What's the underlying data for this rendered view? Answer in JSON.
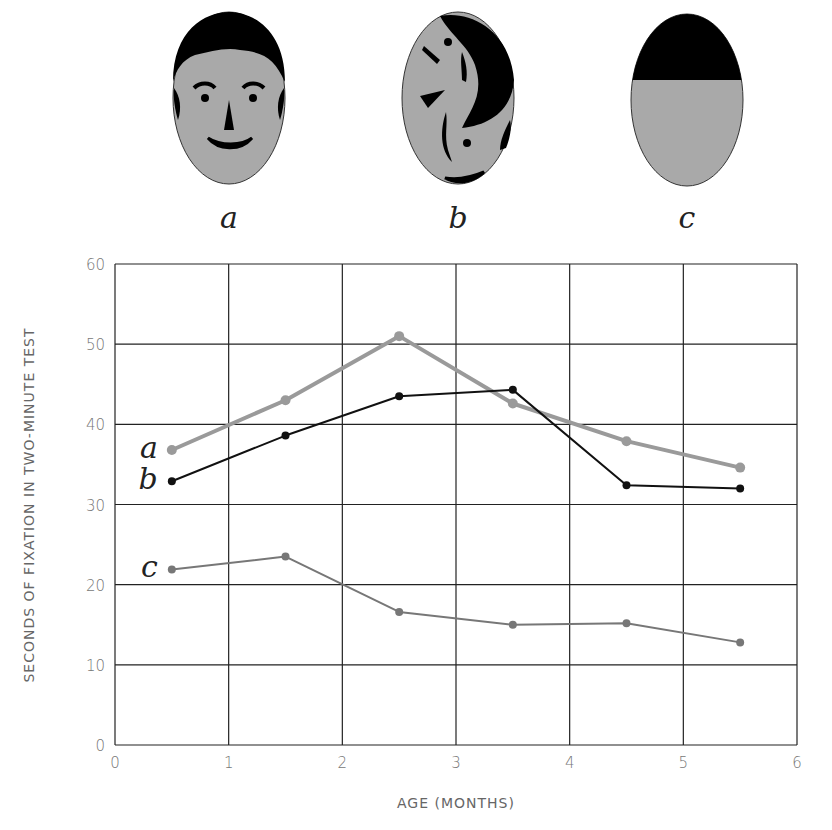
{
  "faces": [
    {
      "label": "a",
      "description": "schematic face"
    },
    {
      "label": "b",
      "description": "scrambled features"
    },
    {
      "label": "c",
      "description": "dark top half, plain"
    }
  ],
  "chart_data": {
    "type": "line",
    "title": "",
    "xlabel": "AGE (MONTHS)",
    "ylabel": "SECONDS OF FIXATION IN TWO-MINUTE TEST",
    "xlim": [
      0,
      6
    ],
    "ylim": [
      0,
      60
    ],
    "x_ticks": [
      "0",
      "1",
      "2",
      "3",
      "4",
      "5",
      "6"
    ],
    "y_ticks": [
      "0",
      "10",
      "20",
      "30",
      "40",
      "50",
      "60"
    ],
    "grid": true,
    "legend": "inline labels at left of each line",
    "x": [
      0.5,
      1.5,
      2.5,
      3.5,
      4.5,
      5.5
    ],
    "series": [
      {
        "name": "a",
        "color": "#9a9a9a",
        "values": [
          36.8,
          43.0,
          51.0,
          42.6,
          37.9,
          34.6
        ]
      },
      {
        "name": "b",
        "color": "#111111",
        "values": [
          32.9,
          38.6,
          43.5,
          44.3,
          32.4,
          32.0
        ]
      },
      {
        "name": "c",
        "color": "#777777",
        "values": [
          21.9,
          23.5,
          16.6,
          15.0,
          15.2,
          12.8
        ]
      }
    ]
  }
}
